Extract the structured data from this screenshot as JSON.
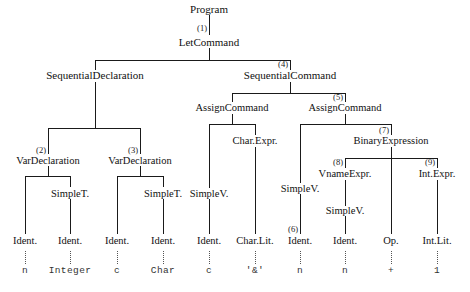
{
  "diagram": {
    "nodes": {
      "program": "Program",
      "let_command": "LetCommand",
      "sequential_declaration": "SequentialDeclaration",
      "sequential_command": "SequentialCommand",
      "var_declaration_1": "VarDeclaration",
      "var_declaration_2": "VarDeclaration",
      "assign_command_1": "AssignCommand",
      "assign_command_2": "AssignCommand",
      "char_expr": "Char.Expr.",
      "binary_expression": "BinaryExpression",
      "vname_expr": "VnameExpr.",
      "int_expr": "Int.Expr.",
      "simple_t_1": "SimpleT.",
      "simple_t_2": "SimpleT.",
      "simple_v_1": "SimpleV.",
      "simple_v_2": "SimpleV.",
      "simple_v_3": "SimpleV.",
      "ident_1": "Ident.",
      "ident_2": "Ident.",
      "ident_3": "Ident.",
      "ident_4": "Ident.",
      "ident_5": "Ident.",
      "char_lit": "Char.Lit.",
      "ident_6": "Ident.",
      "ident_7": "Ident.",
      "op": "Op.",
      "int_lit": "Int.Lit."
    },
    "tags": {
      "t1": "(1)",
      "t2": "(2)",
      "t3": "(3)",
      "t4": "(4)",
      "t5": "(5)",
      "t6": "(6)",
      "t7": "(7)",
      "t8": "(8)",
      "t9": "(9)"
    },
    "terminals": {
      "n1": "n",
      "integer": "Integer",
      "c1": "c",
      "char": "Char",
      "c2": "c",
      "amp": "'&'",
      "n2": "n",
      "n3": "n",
      "plus": "+",
      "one": "1"
    },
    "colors": {
      "edge": "#1a1a1a",
      "dotted_edge": "#555555",
      "text": "#111111",
      "terminal_text": "#333333",
      "background": "#ffffff"
    }
  }
}
